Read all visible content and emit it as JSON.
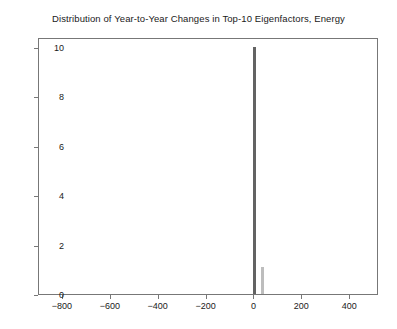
{
  "chart_data": {
    "type": "bar",
    "title": "Distribution of Year-to-Year Changes in Top-10 Eigenfactors, Energy",
    "xlabel": "",
    "ylabel": "",
    "xlim": [
      -900,
      520
    ],
    "ylim": [
      0,
      10.4
    ],
    "xticks": [
      -800,
      -600,
      -400,
      -200,
      0,
      200,
      400
    ],
    "xticklabels": [
      "−800",
      "−600",
      "−400",
      "−200",
      "0",
      "200",
      "400"
    ],
    "yticks": [
      0,
      2,
      4,
      6,
      8,
      10
    ],
    "yticklabels": [
      "0",
      "2",
      "4",
      "6",
      "8",
      "10"
    ],
    "grid": false,
    "legend": null,
    "bar_width_units": 12,
    "bars": [
      {
        "label": "0",
        "x": 0,
        "value": 10.0,
        "color": "#636363"
      },
      {
        "label": "35",
        "x": 35,
        "value": 1.1,
        "color": "#bdbdbd"
      }
    ]
  },
  "figure": {
    "background_color": "#ffffff",
    "frame_color": "#777777",
    "text_color": "#1a1a1a"
  }
}
